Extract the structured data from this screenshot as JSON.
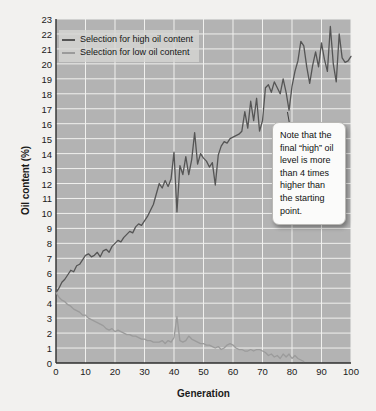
{
  "chart_data": {
    "type": "line",
    "title": "",
    "xlabel": "Generation",
    "ylabel": "Oil content (%)",
    "xlim": [
      0,
      100
    ],
    "ylim": [
      0,
      23
    ],
    "xticks": [
      0,
      10,
      20,
      30,
      40,
      50,
      60,
      70,
      80,
      90,
      100
    ],
    "yticks": [
      0,
      1,
      2,
      3,
      4,
      5,
      6,
      7,
      8,
      9,
      10,
      11,
      12,
      13,
      14,
      15,
      16,
      17,
      18,
      19,
      20,
      21,
      22,
      23
    ],
    "grid": true,
    "legend_position": "top-left",
    "plot_background": "#b3b3b3",
    "page_background": "#f2f1ef",
    "series": [
      {
        "name": "Selection for high oil content",
        "color": "#555555",
        "x": [
          0,
          1,
          2,
          3,
          4,
          5,
          6,
          7,
          8,
          9,
          10,
          11,
          12,
          13,
          14,
          15,
          16,
          17,
          18,
          19,
          20,
          21,
          22,
          23,
          24,
          25,
          26,
          27,
          28,
          29,
          30,
          31,
          32,
          33,
          34,
          35,
          36,
          37,
          38,
          39,
          40,
          41,
          42,
          43,
          44,
          45,
          46,
          47,
          48,
          49,
          50,
          51,
          52,
          53,
          54,
          55,
          56,
          57,
          58,
          59,
          60,
          61,
          62,
          63,
          64,
          65,
          66,
          67,
          68,
          69,
          70,
          71,
          72,
          73,
          74,
          75,
          76,
          77,
          78,
          79,
          80,
          81,
          82,
          83,
          84,
          85,
          86,
          87,
          88,
          89,
          90,
          91,
          92,
          93,
          94,
          95,
          96,
          97,
          98,
          99,
          100
        ],
        "values": [
          4.7,
          5.0,
          5.4,
          5.6,
          5.9,
          6.2,
          6.1,
          6.5,
          6.6,
          6.9,
          7.2,
          7.3,
          7.1,
          7.2,
          7.4,
          7.1,
          7.5,
          7.6,
          7.4,
          7.8,
          8.0,
          8.2,
          8.1,
          8.4,
          8.6,
          8.8,
          8.7,
          9.1,
          9.3,
          9.2,
          9.5,
          9.8,
          10.2,
          10.6,
          11.3,
          12.0,
          11.7,
          12.2,
          11.8,
          12.3,
          14.1,
          10.1,
          13.2,
          12.6,
          13.8,
          12.6,
          13.6,
          15.4,
          13.3,
          14.0,
          13.7,
          13.5,
          13.1,
          13.4,
          11.9,
          13.9,
          14.5,
          14.8,
          14.7,
          15.0,
          15.1,
          15.2,
          15.3,
          15.5,
          16.8,
          15.7,
          17.5,
          16.2,
          17.7,
          15.5,
          16.2,
          18.4,
          18.6,
          18.1,
          18.8,
          18.4,
          18.0,
          19.0,
          18.1,
          16.9,
          18.5,
          19.5,
          20.2,
          21.5,
          21.2,
          19.8,
          18.7,
          19.9,
          20.8,
          19.8,
          21.4,
          20.3,
          19.5,
          22.5,
          20.0,
          18.8,
          22.0,
          20.4,
          20.1,
          20.2,
          20.5
        ]
      },
      {
        "name": "Selection for low oil content",
        "color": "#9b9b9b",
        "x": [
          0,
          1,
          2,
          3,
          4,
          5,
          6,
          7,
          8,
          9,
          10,
          11,
          12,
          13,
          14,
          15,
          16,
          17,
          18,
          19,
          20,
          21,
          22,
          23,
          24,
          25,
          26,
          27,
          28,
          29,
          30,
          31,
          32,
          33,
          34,
          35,
          36,
          37,
          38,
          39,
          40,
          41,
          42,
          43,
          44,
          45,
          46,
          47,
          48,
          49,
          50,
          51,
          52,
          53,
          54,
          55,
          56,
          57,
          58,
          59,
          60,
          61,
          62,
          63,
          64,
          65,
          66,
          67,
          68,
          69,
          70,
          71,
          72,
          73,
          74,
          75,
          76,
          77,
          78,
          79,
          80,
          81,
          82,
          83,
          84
        ],
        "values": [
          4.7,
          4.4,
          4.2,
          4.1,
          3.9,
          3.8,
          3.6,
          3.5,
          3.4,
          3.2,
          3.2,
          3.0,
          2.9,
          2.8,
          2.7,
          2.6,
          2.5,
          2.3,
          2.2,
          2.3,
          2.1,
          2.2,
          2.1,
          2.0,
          1.9,
          1.9,
          1.8,
          1.8,
          1.7,
          1.6,
          1.6,
          1.5,
          1.5,
          1.4,
          1.4,
          1.4,
          1.5,
          1.3,
          1.5,
          1.4,
          1.7,
          3.1,
          1.5,
          1.4,
          1.5,
          1.8,
          1.6,
          1.5,
          1.4,
          1.3,
          1.3,
          1.2,
          1.2,
          1.1,
          1.0,
          1.1,
          0.9,
          1.0,
          1.2,
          1.3,
          1.2,
          1.0,
          0.9,
          0.9,
          0.8,
          0.8,
          0.9,
          0.8,
          0.9,
          0.9,
          0.8,
          0.7,
          0.5,
          0.6,
          0.4,
          0.5,
          0.3,
          0.6,
          0.4,
          0.6,
          0.3,
          0.5,
          0.3,
          0.2,
          0.1
        ]
      }
    ],
    "annotations": [
      {
        "text": "Note that the final “high” oil level is more than 4 times higher than the starting point.",
        "position": "right-middle"
      }
    ]
  }
}
